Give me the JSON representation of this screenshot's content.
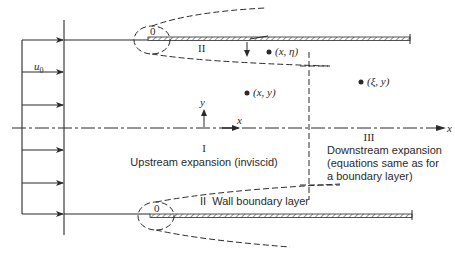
{
  "diagram": {
    "type": "flow-regions",
    "inflow": {
      "velocity_label": "u",
      "velocity_subscript": "0",
      "arrow_count": 6
    },
    "leading_edge_labels": {
      "top": "0",
      "bottom": "0"
    },
    "regions": {
      "region_II_top": "II",
      "region_I_numeral": "I",
      "region_I_desc": "Upstream expansion (inviscid)",
      "region_II_bottom": "II  Wall boundary layer",
      "region_III_numeral": "III",
      "region_III_line1": "Downstream expansion",
      "region_III_line2": "(equations same as for",
      "region_III_line3": "a boundary layer)"
    },
    "points": {
      "x_eta": "(x, η)",
      "x_y": "(x, y)",
      "xi_y": "(ξ, y)"
    },
    "axes": {
      "origin_y_label": "y",
      "origin_x_label": "x",
      "centerline_x_label": "x"
    },
    "colors": {
      "ink": "#2a2a2a",
      "background": "#ffffff"
    }
  }
}
